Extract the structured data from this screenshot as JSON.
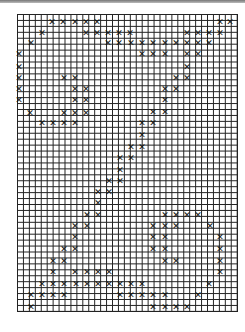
{
  "grid": {
    "cols": 37,
    "rows": 50,
    "cell_px": 5.95,
    "origin": [
      17,
      14
    ],
    "line_color": "#222222",
    "mark_color": "#111111"
  },
  "mark_glyph": "✕",
  "marks_px": [
    [
      52,
      22
    ],
    [
      63,
      22
    ],
    [
      75,
      22
    ],
    [
      86,
      22
    ],
    [
      97,
      22
    ],
    [
      220,
      22
    ],
    [
      230,
      22
    ],
    [
      42,
      33
    ],
    [
      86,
      33
    ],
    [
      97,
      33
    ],
    [
      108,
      33
    ],
    [
      119,
      33
    ],
    [
      130,
      33
    ],
    [
      187,
      33
    ],
    [
      198,
      33
    ],
    [
      209,
      33
    ],
    [
      220,
      33
    ],
    [
      31,
      43
    ],
    [
      108,
      43
    ],
    [
      119,
      43
    ],
    [
      131,
      43
    ],
    [
      142,
      43
    ],
    [
      153,
      43
    ],
    [
      165,
      43
    ],
    [
      176,
      43
    ],
    [
      187,
      43
    ],
    [
      198,
      43
    ],
    [
      209,
      43
    ],
    [
      19,
      54
    ],
    [
      142,
      54
    ],
    [
      153,
      54
    ],
    [
      165,
      54
    ],
    [
      187,
      54
    ],
    [
      198,
      54
    ],
    [
      19,
      67
    ],
    [
      187,
      67
    ],
    [
      19,
      78
    ],
    [
      64,
      78
    ],
    [
      75,
      78
    ],
    [
      176,
      78
    ],
    [
      187,
      78
    ],
    [
      19,
      89
    ],
    [
      75,
      89
    ],
    [
      86,
      89
    ],
    [
      165,
      89
    ],
    [
      176,
      89
    ],
    [
      19,
      100
    ],
    [
      75,
      100
    ],
    [
      86,
      100
    ],
    [
      165,
      100
    ],
    [
      30,
      113
    ],
    [
      64,
      113
    ],
    [
      75,
      113
    ],
    [
      86,
      113
    ],
    [
      153,
      112
    ],
    [
      165,
      112
    ],
    [
      42,
      123
    ],
    [
      53,
      123
    ],
    [
      64,
      123
    ],
    [
      75,
      123
    ],
    [
      142,
      123
    ],
    [
      153,
      123
    ],
    [
      142,
      135
    ],
    [
      131,
      147
    ],
    [
      142,
      147
    ],
    [
      120,
      158
    ],
    [
      131,
      158
    ],
    [
      120,
      170
    ],
    [
      109,
      181
    ],
    [
      120,
      181
    ],
    [
      98,
      192
    ],
    [
      109,
      192
    ],
    [
      98,
      203
    ],
    [
      87,
      215
    ],
    [
      98,
      215
    ],
    [
      165,
      215
    ],
    [
      176,
      215
    ],
    [
      187,
      215
    ],
    [
      198,
      215
    ],
    [
      75,
      226
    ],
    [
      87,
      226
    ],
    [
      153,
      226
    ],
    [
      165,
      226
    ],
    [
      176,
      226
    ],
    [
      210,
      226
    ],
    [
      75,
      237
    ],
    [
      153,
      237
    ],
    [
      165,
      237
    ],
    [
      220,
      237
    ],
    [
      64,
      249
    ],
    [
      75,
      249
    ],
    [
      153,
      249
    ],
    [
      165,
      249
    ],
    [
      220,
      249
    ],
    [
      53,
      261
    ],
    [
      64,
      261
    ],
    [
      165,
      261
    ],
    [
      176,
      261
    ],
    [
      220,
      261
    ],
    [
      53,
      272
    ],
    [
      75,
      272
    ],
    [
      87,
      272
    ],
    [
      98,
      272
    ],
    [
      109,
      272
    ],
    [
      220,
      272
    ],
    [
      42,
      284
    ],
    [
      53,
      284
    ],
    [
      64,
      284
    ],
    [
      76,
      284
    ],
    [
      87,
      284
    ],
    [
      98,
      284
    ],
    [
      109,
      284
    ],
    [
      120,
      284
    ],
    [
      131,
      284
    ],
    [
      142,
      284
    ],
    [
      209,
      284
    ],
    [
      31,
      295
    ],
    [
      42,
      295
    ],
    [
      53,
      295
    ],
    [
      64,
      295
    ],
    [
      120,
      295
    ],
    [
      131,
      295
    ],
    [
      142,
      295
    ],
    [
      153,
      295
    ],
    [
      165,
      295
    ],
    [
      198,
      295
    ],
    [
      31,
      307
    ],
    [
      153,
      307
    ],
    [
      165,
      307
    ],
    [
      176,
      307
    ],
    [
      187,
      307
    ]
  ]
}
